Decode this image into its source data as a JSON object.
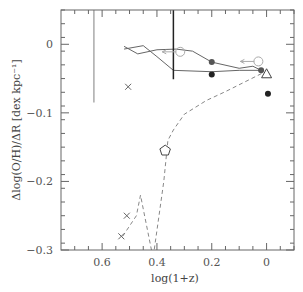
{
  "chart_data": {
    "type": "scatter",
    "title": "",
    "xlabel": "log(1+z)",
    "ylabel": "Δlog(O/H)/ΔR [dex kpc⁻¹]",
    "xlim": [
      0.75,
      -0.1
    ],
    "ylim": [
      -0.3,
      0.05
    ],
    "x_ticks": [
      0.6,
      0.4,
      0.2,
      0
    ],
    "x_tick_labels": [
      "0.6",
      "0.4",
      "0.2",
      "0"
    ],
    "y_ticks": [
      0,
      -0.1,
      -0.2,
      -0.3
    ],
    "y_tick_labels": [
      "0",
      "-0.1",
      "-0.2",
      "-0.3"
    ],
    "grid": false,
    "legend": null,
    "series": [
      {
        "name": "model track A (solid gray, upper)",
        "style": "solid",
        "color": "#666666",
        "x": [
          0.52,
          0.47,
          0.4,
          0.33,
          0.27,
          0.2,
          0.1,
          0.05,
          0.02
        ],
        "y": [
          -0.003,
          -0.014,
          -0.008,
          -0.007,
          -0.01,
          -0.026,
          -0.035,
          -0.032,
          -0.038
        ]
      },
      {
        "name": "model track B (solid gray, lower)",
        "style": "solid",
        "color": "#666666",
        "x": [
          0.52,
          0.45,
          0.4,
          0.34,
          0.2,
          0.1,
          0.02
        ],
        "y": [
          -0.007,
          -0.002,
          -0.018,
          -0.038,
          -0.04,
          -0.038,
          -0.038
        ]
      },
      {
        "name": "model track (dashed)",
        "style": "dashed",
        "color": "#888888",
        "x": [
          0.525,
          0.475,
          0.46,
          0.42,
          0.41,
          0.375,
          0.36,
          0.34,
          0.3,
          0.22,
          0.15,
          0.01
        ],
        "y": [
          -0.28,
          -0.25,
          -0.22,
          -0.3,
          -0.3,
          -0.2,
          -0.14,
          -0.125,
          -0.102,
          -0.082,
          -0.069,
          -0.041
        ]
      },
      {
        "name": "vertical marker (light gray)",
        "style": "vline",
        "color": "#aaaaaa",
        "x": [
          0.63,
          0.63
        ],
        "y": [
          0.05,
          -0.085
        ]
      },
      {
        "name": "vertical marker (black)",
        "style": "vline",
        "color": "#222222",
        "x": [
          0.34,
          0.34
        ],
        "y": [
          0.05,
          -0.051
        ]
      },
      {
        "name": "crosses",
        "marker": "x",
        "color": "#666666",
        "x": [
          0.505,
          0.51,
          0.53
        ],
        "y": [
          -0.062,
          -0.25,
          -0.28
        ]
      },
      {
        "name": "filled circles (gray)",
        "marker": "circle-filled",
        "color": "#555555",
        "x": [
          0.2,
          0.02
        ],
        "y": [
          -0.026,
          -0.038
        ]
      },
      {
        "name": "filled circles (black)",
        "marker": "circle-filled",
        "color": "#222222",
        "x": [
          0.2,
          -0.005
        ],
        "y": [
          -0.044,
          -0.072
        ]
      },
      {
        "name": "open circles with arrows",
        "marker": "circle-open",
        "color": "#aaaaaa",
        "x": [
          0.315,
          0.03
        ],
        "y": [
          -0.011,
          -0.025
        ]
      },
      {
        "name": "open triangle",
        "marker": "triangle-open",
        "color": "#444444",
        "x": [
          0.0
        ],
        "y": [
          -0.043
        ]
      },
      {
        "name": "open pentagon",
        "marker": "pentagon-open",
        "color": "#444444",
        "x": [
          0.37
        ],
        "y": [
          -0.155
        ]
      }
    ]
  }
}
